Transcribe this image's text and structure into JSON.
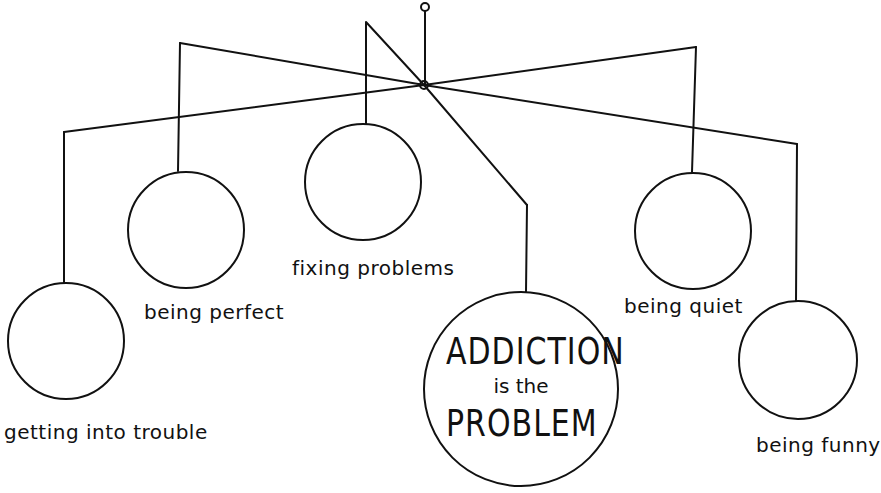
{
  "diagram": {
    "type": "mobile",
    "stroke_color": "#111111",
    "background": "#ffffff",
    "center": {
      "line1": "ADDICTION",
      "line2": "is the",
      "line3": "PROBLEM"
    },
    "roles": [
      {
        "label": "getting into trouble"
      },
      {
        "label": "being perfect"
      },
      {
        "label": "fixing problems"
      },
      {
        "label": "being quiet"
      },
      {
        "label": "being funny"
      }
    ]
  }
}
